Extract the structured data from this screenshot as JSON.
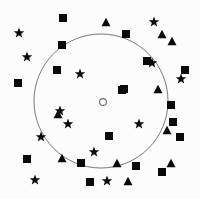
{
  "figure": {
    "title": "",
    "width": 200,
    "height": 199,
    "background_color": "#fcfcfc",
    "marker_color": "#0a0a0a",
    "circle_stroke_color": "#6b6b6b"
  },
  "chart_data": {
    "type": "scatter",
    "title": "",
    "xlabel": "",
    "ylabel": "",
    "xlim": [
      0,
      200
    ],
    "ylim": [
      0,
      199
    ],
    "grid": false,
    "legend_position": "none",
    "annotations": [
      {
        "name": "boundary-circle",
        "shape": "circle",
        "filled": false,
        "cx": 101,
        "cy": 101,
        "r": 67,
        "stroke_width": 0.9
      },
      {
        "name": "center-point",
        "shape": "circle",
        "filled": false,
        "cx": 103,
        "cy": 102,
        "r": 3.4,
        "stroke_width": 1.1
      }
    ],
    "series": [
      {
        "name": "squares",
        "marker": "square",
        "size": 8,
        "count": 18,
        "points": [
          {
            "x": 63,
            "y": 18
          },
          {
            "x": 126,
            "y": 34
          },
          {
            "x": 62,
            "y": 45
          },
          {
            "x": 57,
            "y": 70
          },
          {
            "x": 185,
            "y": 70
          },
          {
            "x": 18,
            "y": 83
          },
          {
            "x": 124,
            "y": 89
          },
          {
            "x": 122,
            "y": 90
          },
          {
            "x": 171,
            "y": 105
          },
          {
            "x": 109,
            "y": 136
          },
          {
            "x": 180,
            "y": 137
          },
          {
            "x": 27,
            "y": 159
          },
          {
            "x": 81,
            "y": 163
          },
          {
            "x": 136,
            "y": 166
          },
          {
            "x": 162,
            "y": 172
          },
          {
            "x": 90,
            "y": 182
          },
          {
            "x": 147,
            "y": 61
          },
          {
            "x": 173,
            "y": 122
          }
        ]
      },
      {
        "name": "stars",
        "marker": "star",
        "size": 11,
        "count": 13,
        "points": [
          {
            "x": 19,
            "y": 33
          },
          {
            "x": 154,
            "y": 22
          },
          {
            "x": 27,
            "y": 57
          },
          {
            "x": 152,
            "y": 63
          },
          {
            "x": 80,
            "y": 74
          },
          {
            "x": 181,
            "y": 79
          },
          {
            "x": 68,
            "y": 124
          },
          {
            "x": 139,
            "y": 124
          },
          {
            "x": 41,
            "y": 137
          },
          {
            "x": 94,
            "y": 152
          },
          {
            "x": 35,
            "y": 180
          },
          {
            "x": 107,
            "y": 181
          },
          {
            "x": 60,
            "y": 111
          }
        ]
      },
      {
        "name": "triangles",
        "marker": "triangle",
        "size": 9,
        "count": 10,
        "points": [
          {
            "x": 106,
            "y": 22
          },
          {
            "x": 162,
            "y": 34
          },
          {
            "x": 172,
            "y": 41
          },
          {
            "x": 158,
            "y": 89
          },
          {
            "x": 58,
            "y": 114
          },
          {
            "x": 167,
            "y": 130
          },
          {
            "x": 62,
            "y": 158
          },
          {
            "x": 117,
            "y": 163
          },
          {
            "x": 171,
            "y": 163
          },
          {
            "x": 128,
            "y": 181
          }
        ]
      }
    ]
  }
}
